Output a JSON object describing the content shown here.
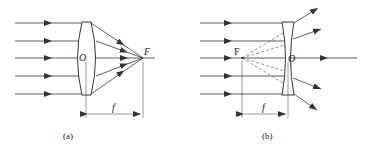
{
  "diagrams": [
    {
      "id": "a",
      "caption": "(a)",
      "lens_type": "convex",
      "center_label": "O",
      "focus_label": "F",
      "focal_length_label": "f"
    },
    {
      "id": "b",
      "caption": "(b)",
      "lens_type": "concave",
      "center_label": "O",
      "focus_label": "F",
      "focal_length_label": "f"
    }
  ],
  "colors": {
    "line": "#333333",
    "lens_fill": "#ffffff"
  }
}
